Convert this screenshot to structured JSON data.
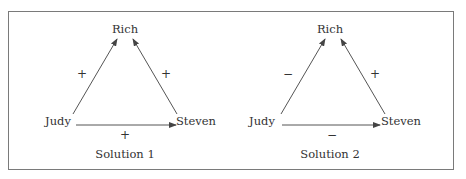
{
  "panels": [
    {
      "caption": "Solution 1",
      "nodes": {
        "top": "Rich",
        "left": "Judy",
        "right": "Steven"
      },
      "edges": {
        "judy_to_rich": "+",
        "steven_to_rich": "+",
        "judy_to_steven": "+"
      }
    },
    {
      "caption": "Solution 2",
      "nodes": {
        "top": "Rich",
        "left": "Judy",
        "right": "Steven"
      },
      "edges": {
        "judy_to_rich": "−",
        "steven_to_rich": "+",
        "judy_to_steven": "−"
      }
    }
  ],
  "colors": {
    "line": "#555555",
    "border": "#7a7a7a",
    "text": "#333333"
  }
}
